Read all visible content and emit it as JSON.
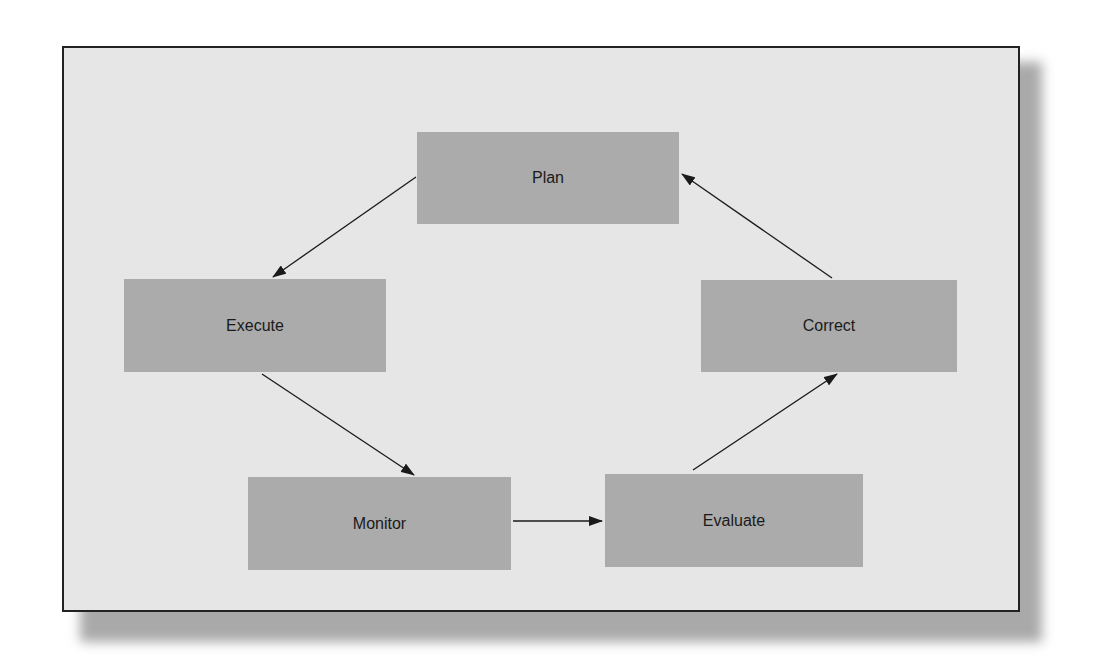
{
  "diagram": {
    "type": "cycle",
    "nodes": [
      {
        "id": "plan",
        "label": "Plan"
      },
      {
        "id": "execute",
        "label": "Execute"
      },
      {
        "id": "monitor",
        "label": "Monitor"
      },
      {
        "id": "evaluate",
        "label": "Evaluate"
      },
      {
        "id": "correct",
        "label": "Correct"
      }
    ],
    "edges": [
      {
        "from": "plan",
        "to": "execute"
      },
      {
        "from": "execute",
        "to": "monitor"
      },
      {
        "from": "monitor",
        "to": "evaluate"
      },
      {
        "from": "evaluate",
        "to": "correct"
      },
      {
        "from": "correct",
        "to": "plan"
      }
    ],
    "colors": {
      "background": "#e6e6e6",
      "node": "#ababab",
      "border": "#222222",
      "shadow": "#a9a9a9"
    }
  }
}
